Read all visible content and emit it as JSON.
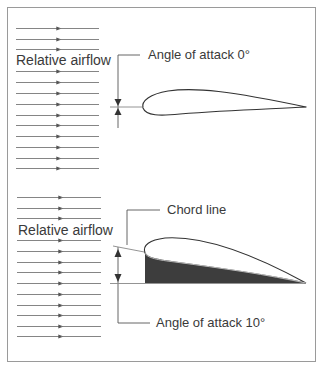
{
  "figure": {
    "colors": {
      "background": "#ffffff",
      "border": "#9a9a9a",
      "line": "#555555",
      "text": "#3a3a3a",
      "fill": "#3d3d3d"
    }
  },
  "top_panel": {
    "flow_label": "Relative airflow",
    "angle_label": "Angle of attack 0°",
    "angle_value_deg": 0,
    "flow_lines_y": [
      28,
      39,
      49,
      71,
      82,
      93,
      104,
      115,
      125,
      136,
      147,
      158,
      168
    ]
  },
  "bottom_panel": {
    "flow_label": "Relative airflow",
    "chord_label": "Chord line",
    "angle_label": "Angle of attack 10°",
    "angle_value_deg": 10,
    "flow_lines_y": [
      197,
      208,
      218,
      240,
      251,
      262,
      272,
      283,
      294,
      305,
      315,
      326,
      336
    ]
  }
}
